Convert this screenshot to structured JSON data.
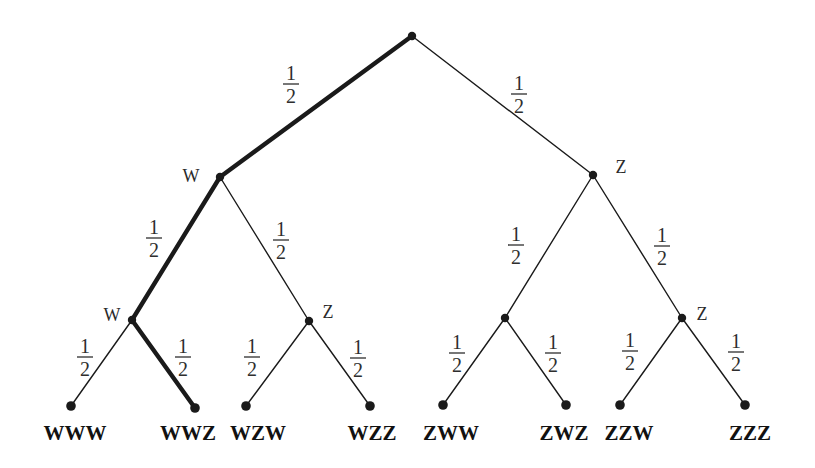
{
  "diagram": {
    "type": "probability-tree",
    "background_color": "#ffffff",
    "ink_color": "#1a1a1a",
    "label_color": "#2a2a2a",
    "thin_stroke": 1.4,
    "bold_stroke": 4.4,
    "node_radius": 4.2,
    "probability": {
      "numerator": "1",
      "denominator": "2"
    },
    "nodes": [
      {
        "id": "root",
        "x": 412,
        "y": 36,
        "label": "",
        "label_x": 0,
        "label_y": 0
      },
      {
        "id": "w1",
        "x": 220,
        "y": 177,
        "label": "W",
        "label_x": 191,
        "label_y": 182
      },
      {
        "id": "z1",
        "x": 593,
        "y": 175,
        "label": "Z",
        "label_x": 621,
        "label_y": 173
      },
      {
        "id": "ww2",
        "x": 132,
        "y": 320,
        "label": "W",
        "label_x": 112,
        "label_y": 321
      },
      {
        "id": "wz2",
        "x": 309,
        "y": 321,
        "label": "Z",
        "label_x": 328,
        "label_y": 318
      },
      {
        "id": "zw2",
        "x": 505,
        "y": 318,
        "label": "",
        "label_x": 0,
        "label_y": 0
      },
      {
        "id": "zz2",
        "x": 682,
        "y": 318,
        "label": "Z",
        "label_x": 702,
        "label_y": 320
      }
    ],
    "leaves": [
      {
        "id": "WWW",
        "x": 71,
        "y": 406,
        "label": "WWW",
        "label_x": 75,
        "label_y": 440
      },
      {
        "id": "WWZ",
        "x": 195,
        "y": 408,
        "label": "WWZ",
        "label_x": 188,
        "label_y": 440
      },
      {
        "id": "WZW",
        "x": 246,
        "y": 406,
        "label": "WZW",
        "label_x": 258,
        "label_y": 440
      },
      {
        "id": "WZZ",
        "x": 370,
        "y": 406,
        "label": "WZZ",
        "label_x": 372,
        "label_y": 440
      },
      {
        "id": "ZWW",
        "x": 443,
        "y": 405,
        "label": "ZWW",
        "label_x": 451,
        "label_y": 440
      },
      {
        "id": "ZWZ",
        "x": 566,
        "y": 405,
        "label": "ZWZ",
        "label_x": 564,
        "label_y": 440
      },
      {
        "id": "ZZW",
        "x": 620,
        "y": 405,
        "label": "ZZW",
        "label_x": 629,
        "label_y": 440
      },
      {
        "id": "ZZZ",
        "x": 745,
        "y": 405,
        "label": "ZZZ",
        "label_x": 750,
        "label_y": 440
      }
    ],
    "edges": [
      {
        "from": "root",
        "to": "w1",
        "bold": true,
        "frac_x": 291,
        "frac_y": 84
      },
      {
        "from": "root",
        "to": "z1",
        "bold": false,
        "frac_x": 519,
        "frac_y": 94
      },
      {
        "from": "w1",
        "to": "ww2",
        "bold": true,
        "frac_x": 154,
        "frac_y": 238
      },
      {
        "from": "w1",
        "to": "wz2",
        "bold": false,
        "frac_x": 281,
        "frac_y": 240
      },
      {
        "from": "z1",
        "to": "zw2",
        "bold": false,
        "frac_x": 516,
        "frac_y": 245
      },
      {
        "from": "z1",
        "to": "zz2",
        "bold": false,
        "frac_x": 662,
        "frac_y": 246
      },
      {
        "from": "ww2",
        "to": "WWW",
        "bold": false,
        "frac_x": 85,
        "frac_y": 357
      },
      {
        "from": "ww2",
        "to": "WWZ",
        "bold": true,
        "frac_x": 183,
        "frac_y": 357
      },
      {
        "from": "wz2",
        "to": "WZW",
        "bold": false,
        "frac_x": 252,
        "frac_y": 357
      },
      {
        "from": "wz2",
        "to": "WZZ",
        "bold": false,
        "frac_x": 358,
        "frac_y": 358
      },
      {
        "from": "zw2",
        "to": "ZWW",
        "bold": false,
        "frac_x": 457,
        "frac_y": 353
      },
      {
        "from": "zw2",
        "to": "ZWZ",
        "bold": false,
        "frac_x": 553,
        "frac_y": 353
      },
      {
        "from": "zz2",
        "to": "ZZW",
        "bold": false,
        "frac_x": 630,
        "frac_y": 351
      },
      {
        "from": "zz2",
        "to": "ZZZ",
        "bold": false,
        "frac_x": 736,
        "frac_y": 352
      }
    ]
  }
}
